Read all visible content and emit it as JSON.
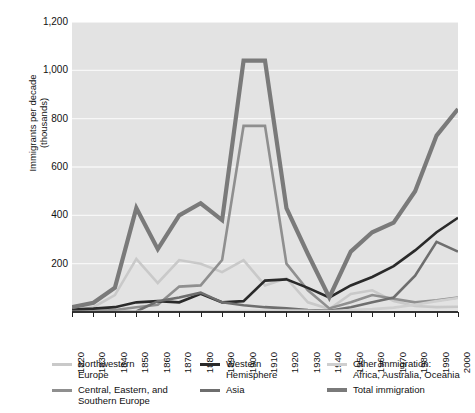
{
  "chart_data": {
    "type": "line",
    "title": "",
    "xlabel": "",
    "ylabel": "Immigrants per decade\n(thousands)",
    "xlim": [
      1820,
      2000
    ],
    "ylim": [
      0,
      1200
    ],
    "ytick_labels": [
      "1,200",
      "1,000",
      "800",
      "600",
      "400",
      "200"
    ],
    "ytick_values": [
      1200,
      1000,
      800,
      600,
      400,
      200
    ],
    "xtick_labels": [
      "1820",
      "1830",
      "1840",
      "1850",
      "1860",
      "1870",
      "1880",
      "1890",
      "1900",
      "1910",
      "1920",
      "1930",
      "1940",
      "1950",
      "1960",
      "1970",
      "1980",
      "1990",
      "2000"
    ],
    "x": [
      1820,
      1830,
      1840,
      1850,
      1860,
      1870,
      1880,
      1890,
      1900,
      1910,
      1920,
      1930,
      1940,
      1950,
      1960,
      1970,
      1980,
      1990,
      2000
    ],
    "grid": true,
    "grid_axis": "y",
    "legend_position": "below",
    "plot_background": "#e3e3e3",
    "series": [
      {
        "name": "Northwestern Europe",
        "color": "#c9c9c9",
        "width": 2.6,
        "values": [
          8,
          20,
          70,
          220,
          120,
          215,
          200,
          165,
          215,
          110,
          140,
          40,
          12,
          75,
          90,
          45,
          25,
          20,
          22
        ]
      },
      {
        "name": "Central, Eastern, and Southern Europe",
        "color": "#8f8f8f",
        "width": 2.6,
        "values": [
          2,
          4,
          8,
          20,
          30,
          105,
          110,
          215,
          770,
          770,
          200,
          90,
          15,
          40,
          70,
          55,
          40,
          48,
          60
        ]
      },
      {
        "name": "Western Hemisphere",
        "color": "#2a2a2a",
        "width": 2.6,
        "values": [
          10,
          14,
          20,
          40,
          45,
          40,
          75,
          40,
          45,
          130,
          135,
          100,
          60,
          110,
          145,
          190,
          255,
          330,
          390
        ]
      },
      {
        "name": "Asia",
        "color": "#6e6e6e",
        "width": 2.6,
        "values": [
          0,
          0,
          0,
          2,
          45,
          60,
          80,
          40,
          28,
          20,
          15,
          8,
          5,
          20,
          40,
          60,
          150,
          290,
          250
        ]
      },
      {
        "name": "Other immigration: Africa, Australia, Oceania",
        "color": "#cfcfcf",
        "width": 2.6,
        "values": [
          0,
          0,
          0,
          1,
          2,
          2,
          3,
          3,
          4,
          5,
          6,
          5,
          3,
          8,
          12,
          18,
          30,
          45,
          58
        ]
      },
      {
        "name": "Total immigration",
        "color": "#7a7a7a",
        "width": 4.2,
        "values": [
          20,
          38,
          100,
          430,
          260,
          400,
          450,
          380,
          1040,
          1040,
          430,
          240,
          60,
          250,
          330,
          370,
          500,
          730,
          840
        ]
      }
    ],
    "legend_entries": [
      {
        "label": "Northwestern\nEurope",
        "color": "#c9c9c9",
        "thick": false
      },
      {
        "label": "Central, Eastern, and\nSouthern Europe",
        "color": "#8f8f8f",
        "thick": false
      },
      {
        "label": "Western\nHemisphere",
        "color": "#2a2a2a",
        "thick": false
      },
      {
        "label": "Asia",
        "color": "#6e6e6e",
        "thick": false
      },
      {
        "label": "Other immigration:\nAfrica, Australia, Oceania",
        "color": "#cfcfcf",
        "thick": false
      },
      {
        "label": "Total immigration",
        "color": "#7a7a7a",
        "thick": true
      }
    ]
  }
}
